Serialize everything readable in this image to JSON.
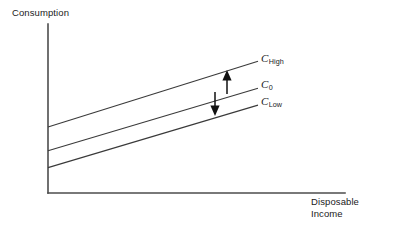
{
  "figure": {
    "background_color": "#ffffff",
    "line_color": "#3a3a3a",
    "axis_color": "#4d4d4d",
    "arrow_color": "#111111"
  },
  "axes": {
    "y_label": "Consumption",
    "x_label": "Disposable\nIncome"
  },
  "curve_labels": {
    "high": {
      "base": "C",
      "sub": "High"
    },
    "zero": {
      "base": "C",
      "sub": "0"
    },
    "low": {
      "base": "C",
      "sub": "Low"
    }
  },
  "chart_data": {
    "type": "line",
    "title": "",
    "subtitle": "",
    "xlabel": "Disposable Income",
    "ylabel": "Consumption",
    "xlim": [
      0,
      1
    ],
    "ylim": [
      0,
      1
    ],
    "grid": false,
    "legend_position": "right-of-line-ends",
    "axes_style": "open-corner-L (no ticks, no numeric tick labels)",
    "x": [
      0,
      1
    ],
    "series": [
      {
        "name": "C_High",
        "label": "C High",
        "values": [
          0.39,
          0.78
        ],
        "note": "upper parallel consumption function, higher autonomous consumption"
      },
      {
        "name": "C_0",
        "label": "C 0",
        "values": [
          0.25,
          0.62
        ],
        "note": "baseline consumption function"
      },
      {
        "name": "C_Low",
        "label": "C Low",
        "values": [
          0.15,
          0.52
        ],
        "note": "lower parallel consumption function, lower autonomous consumption"
      }
    ],
    "annotations": [
      {
        "type": "arrow",
        "name": "upward-shift-arrow",
        "direction": "up",
        "from_series": "C_0",
        "to_series": "C_High",
        "meaning": "increase in autonomous consumption shifts the curve up"
      },
      {
        "type": "arrow",
        "name": "downward-shift-arrow",
        "direction": "down",
        "from_series": "C_0",
        "to_series": "C_Low",
        "meaning": "decrease in autonomous consumption shifts the curve down"
      }
    ]
  }
}
